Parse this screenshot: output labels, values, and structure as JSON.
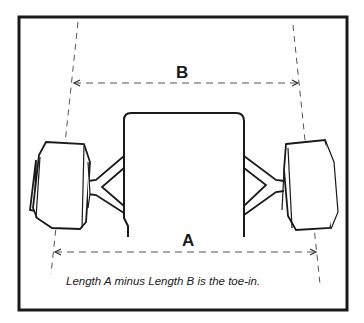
{
  "diagram": {
    "labels": {
      "b": "B",
      "a": "A"
    },
    "caption": "Length A minus Length B is the toe-in.",
    "colors": {
      "line": "#1a1a1a",
      "dash": "#555555",
      "background": "#ffffff"
    }
  }
}
